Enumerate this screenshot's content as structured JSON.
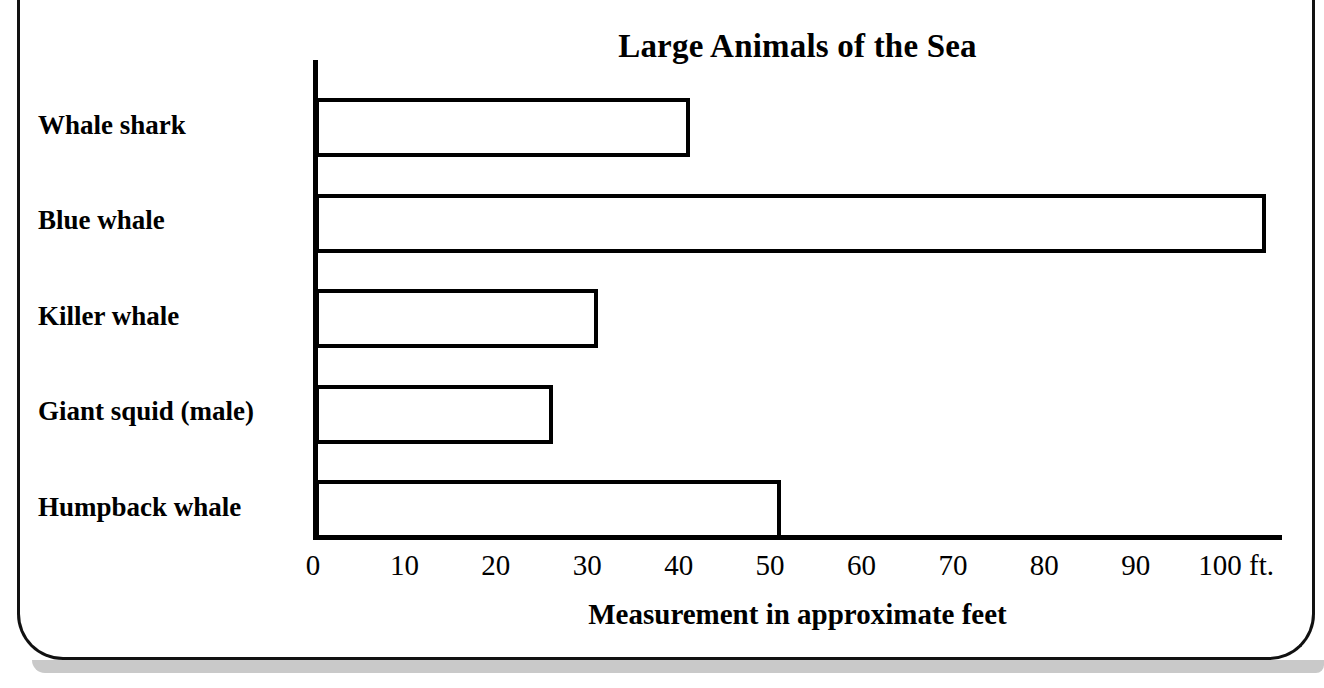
{
  "chart_data": {
    "type": "bar",
    "orientation": "horizontal",
    "title": "Large Animals of the Sea",
    "xlabel": "Measurement in approximate feet",
    "ylabel": "",
    "categories": [
      "Whale shark",
      "Blue whale",
      "Killer whale",
      "Giant squid (male)",
      "Humpback whale"
    ],
    "values": [
      41,
      104,
      31,
      26,
      51
    ],
    "unit": "ft.",
    "xlim": [
      0,
      106
    ],
    "xticks": [
      0,
      10,
      20,
      30,
      40,
      50,
      60,
      70,
      80,
      90,
      100
    ],
    "xtick_labels": [
      "0",
      "10",
      "20",
      "30",
      "40",
      "50",
      "60",
      "70",
      "80",
      "90",
      "100 ft."
    ],
    "grid": false,
    "legend": false,
    "bar_fill_color": "#ffffff",
    "bar_edge_color": "#000000",
    "axis_color": "#000000",
    "background_color": "#ffffff"
  },
  "frame": {
    "border_color": "#111111",
    "shadow_color": "#c9c9c9"
  }
}
